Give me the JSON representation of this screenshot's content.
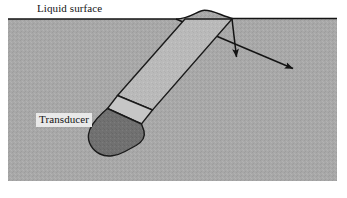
{
  "figure": {
    "type": "technical-cross-section-diagram",
    "width": 347,
    "height": 198
  },
  "labels": {
    "liquid_surface": "Liquid surface",
    "transducer": "Transducer"
  },
  "colors": {
    "page_background": "#ffffff",
    "liquid_fill": "#a8a8a8",
    "probe_shaft_fill": "#b8b8b8",
    "probe_collar_fill": "#c2c2c2",
    "probe_tip_fill": "#6f6f6f",
    "outline": "#1a1a1a",
    "surface_line": "#141414",
    "label_box_background": "#e9e9e9",
    "label_text": "#141414"
  },
  "geometry": {
    "liquid_region": {
      "left": 8,
      "top": 19,
      "right": 337,
      "bottom": 181
    },
    "surface_line_y": 19,
    "meniscus": {
      "start_x": 176,
      "end_x": 233,
      "peak_y": 10
    },
    "probe_shaft": {
      "top_left": [
        185,
        19
      ],
      "top_right": [
        232,
        19
      ],
      "bottom_right": [
        152,
        110
      ],
      "bottom_left": [
        117,
        96
      ]
    },
    "probe_collar": {
      "top_left": [
        117,
        96
      ],
      "top_right": [
        152,
        110
      ],
      "bottom_right": [
        141,
        124
      ],
      "bottom_left": [
        108,
        108
      ]
    },
    "probe_tip": {
      "apex_left": [
        108,
        108
      ],
      "apex_right": [
        141,
        124
      ],
      "bulb_bottom_y": 156,
      "bulb_left_x": 88
    }
  },
  "annotations": {
    "beam_lines": [
      {
        "name": "incident-beam-left-edge",
        "from": [
          185,
          19
        ],
        "to": [
          117,
          96
        ]
      },
      {
        "name": "incident-beam-right-edge",
        "from": [
          232,
          19
        ],
        "to": [
          152,
          110
        ]
      }
    ],
    "arrows": [
      {
        "name": "vertical-beam-arrow",
        "direction": "down",
        "from": [
          232,
          19
        ],
        "to": [
          237,
          62
        ]
      },
      {
        "name": "refracted-beam-arrow",
        "direction": "down-right",
        "from": [
          176,
          19
        ],
        "to": [
          297,
          70
        ]
      }
    ]
  }
}
